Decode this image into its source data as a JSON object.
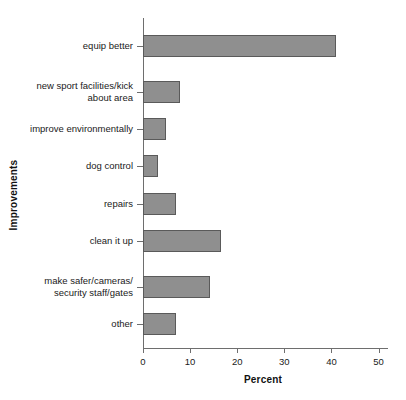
{
  "chart_data": {
    "type": "bar",
    "orientation": "horizontal",
    "title": "",
    "xlabel": "Percent",
    "ylabel": "Improvements",
    "categories": [
      "equip better",
      "new sport facilities/kick about area",
      "improve environmentally",
      "dog control",
      "repairs",
      "clean it up",
      "make safer/cameras/ security staff/gates",
      "other"
    ],
    "category_lines": [
      [
        "equip better"
      ],
      [
        "new sport facilities/kick",
        "about area"
      ],
      [
        "improve environmentally"
      ],
      [
        "dog control"
      ],
      [
        "repairs"
      ],
      [
        "clean it up"
      ],
      [
        "make safer/cameras/",
        "security staff/gates"
      ],
      [
        "other"
      ]
    ],
    "values": [
      41.0,
      7.8,
      4.8,
      3.1,
      7.0,
      16.6,
      14.3,
      6.9
    ],
    "xlim": [
      0,
      52
    ],
    "xticks": [
      0,
      10,
      20,
      30,
      40,
      50
    ],
    "xtick_labels": [
      "0",
      "10",
      "20",
      "30",
      "40",
      "50"
    ],
    "grid": false,
    "legend": false,
    "bar_fill_color": "#8f8f8f",
    "bar_edge_color": "#5a5a5a",
    "axis_color": "#6e6e6e"
  }
}
